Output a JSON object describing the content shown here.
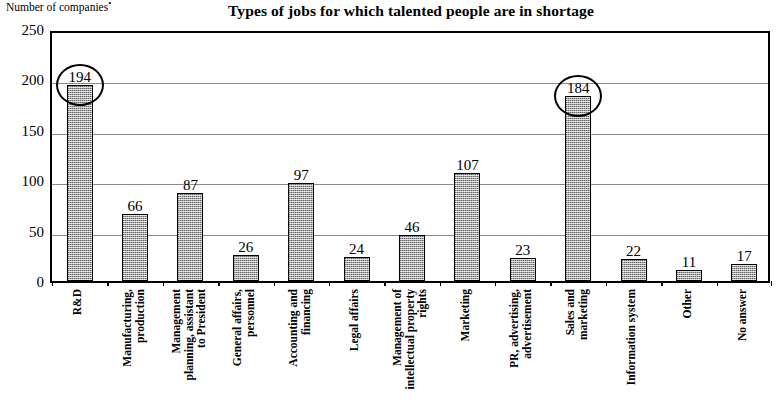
{
  "chart_data": {
    "type": "bar",
    "title": "Types of jobs for which talented people are in shortage",
    "ylabel": "Number of companies",
    "ylabel_superscript": "•",
    "xlabel": "",
    "ylim": [
      0,
      250
    ],
    "yticks": [
      0,
      50,
      100,
      150,
      200,
      250
    ],
    "ytick_labels": [
      "0",
      "50",
      "100",
      "150",
      "200",
      "250"
    ],
    "grid": true,
    "grid_axis": "y",
    "legend": "none",
    "bar_fill": "#a8a8a8",
    "bar_edge": "#000000",
    "categories": [
      "R&D",
      "Manufacturing, production",
      "Management planning, assistant to President",
      "General affairs, personnel",
      "Accounting and financing",
      "Legal affairs",
      "Management of intellectual property rights",
      "Marketing",
      "PR, advertising, advertisement",
      "Sales and marketing",
      "Information system",
      "Other",
      "No answer"
    ],
    "category_lines": [
      [
        "R&D"
      ],
      [
        "Manufacturing,",
        "production"
      ],
      [
        "Management",
        "planning, assistant",
        "to President"
      ],
      [
        "General affairs,",
        "personnel"
      ],
      [
        "Accounting and",
        "financing"
      ],
      [
        "Legal affairs"
      ],
      [
        "Management of",
        "intellectual property",
        "rights"
      ],
      [
        "Marketing"
      ],
      [
        "PR, advertising,",
        "advertisement"
      ],
      [
        "Sales and",
        "marketing"
      ],
      [
        "Information system"
      ],
      [
        "Other"
      ],
      [
        "No answer"
      ]
    ],
    "values": [
      194,
      66,
      87,
      26,
      97,
      24,
      46,
      107,
      23,
      184,
      22,
      11,
      17
    ],
    "value_labels": [
      "194",
      "66",
      "87",
      "26",
      "97",
      "24",
      "46",
      "107",
      "23",
      "184",
      "22",
      "11",
      "17"
    ],
    "highlighted_indices": [
      0,
      9
    ],
    "highlight_style": "black ellipse outline around value label"
  }
}
